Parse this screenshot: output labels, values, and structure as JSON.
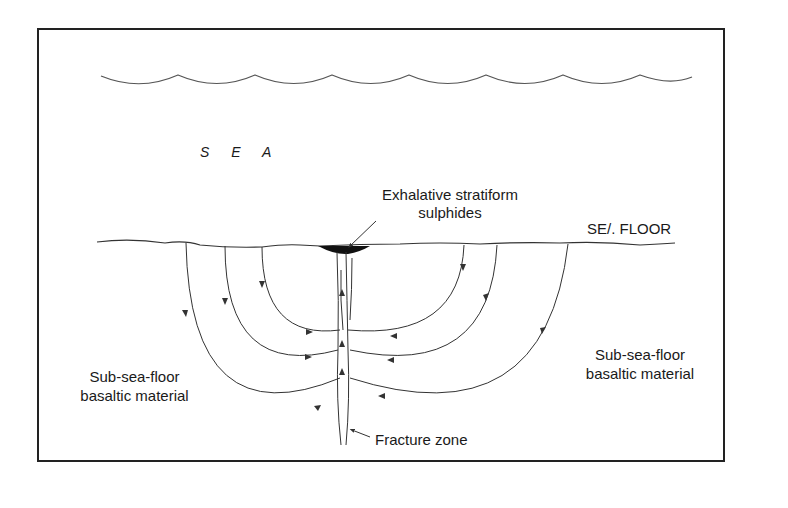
{
  "diagram": {
    "type": "cross-section",
    "labels": {
      "sea": "S E A",
      "sea_floor": "SE/. FLOOR",
      "deposit_line1": "Exhalative stratiform",
      "deposit_line2": "sulphides",
      "left_basalt_line1": "Sub-sea-floor",
      "left_basalt_line2": "basaltic material",
      "right_basalt_line1": "Sub-sea-floor",
      "right_basalt_line2": "basaltic material",
      "fracture_zone": "Fracture zone"
    },
    "elements": {
      "sea_surface": "wavy-line",
      "sea_floor": "irregular-line",
      "deposit": "black lens at vent",
      "fracture": "vertical fracture zone",
      "flow_cells": "convective circulation arrows (3 each side)"
    },
    "colors": {
      "line": "#333333",
      "text": "#1a1a1a",
      "background": "#ffffff"
    }
  }
}
